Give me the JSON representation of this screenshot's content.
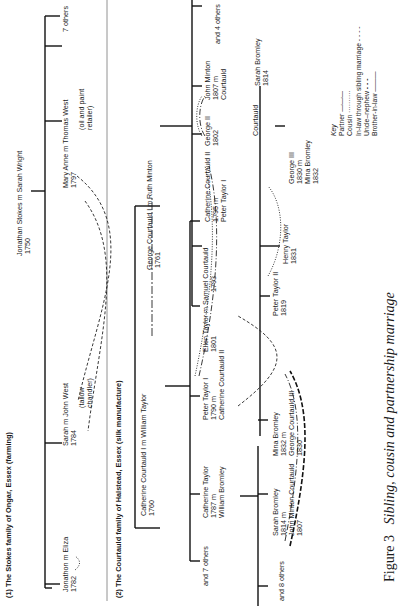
{
  "figure": {
    "label": "Figure 3",
    "title": "Sibling, cousin and partnership marriage"
  },
  "stokes": {
    "heading": "(1) The Stokes family of Ongar, Essex (farming)",
    "parents": {
      "line1": "Jonathan Stokes m Sarah Wright",
      "line2": "1750"
    },
    "children": [
      {
        "line1": "Jonathon  m  Eliza",
        "line2": "1782"
      },
      {
        "line1": "Sarah   m   John West",
        "line2": "1784",
        "line3": "(tallow",
        "line4": "chandler)"
      },
      {
        "line1": "Mary Anne   m   Thomas West",
        "line2": "1797",
        "line3": "(oil and paint",
        "line4": "retailer)"
      },
      {
        "line1": "7 others"
      }
    ]
  },
  "courtauld": {
    "heading": "(2) The Courtauld family of Halstead, Essex (silk manufacture)",
    "gen1": {
      "catherine": {
        "line1": "Catherine Courtauld I  m  William Taylor",
        "line2": "1760"
      },
      "george": {
        "line1": "George Courtauld I  m  Ruth Minton",
        "line2": "1761"
      }
    },
    "taylor_children": [
      {
        "line1": "and 7 others"
      },
      {
        "line1": "Catherine Taylor",
        "line2": "1787  m",
        "line3": "William Bromley"
      },
      {
        "line1": "Peter Taylor I",
        "line2": "1790  m",
        "line3": "Catherine Courtauld II"
      },
      {
        "line1": "Ellen Taylor  m  Samuel Courtauld",
        "line2": "1801",
        "line3": "1793"
      }
    ],
    "courtauld_children": [
      {
        "line1": "Catherine Courtauld II",
        "line2": "1795  m",
        "line3": "Peter Taylor I"
      },
      {
        "line1": "George II",
        "line2": "1802"
      },
      {
        "line1": "John Minton",
        "line2": "1807  m",
        "line3": "Courtauld"
      },
      {
        "line1": "and 4 others"
      }
    ],
    "bromley_children": [
      {
        "line1": "and 8 others"
      },
      {
        "line1": "Sarah Bromley",
        "line2": "1814  m",
        "line3": "John Minton Courtauld",
        "line4": "1807"
      },
      {
        "line1": "Mina Bromley",
        "line2": "1832  m",
        "line3": "George Courtauld III",
        "line4": "1830"
      }
    ],
    "peter_children": [
      {
        "line1": "Peter Taylor II",
        "line2": "1819"
      },
      {
        "line1": "Henry Taylor",
        "line2": "1831"
      }
    ],
    "john_children": [
      {
        "line1": "Courtauld"
      },
      {
        "line1": "George III",
        "line2": "1830  m",
        "line3": "Mina Bromley",
        "line4": "1832"
      },
      {
        "line1": "Sarah Bromley",
        "line2": "1814"
      }
    ]
  },
  "key": {
    "title": "Key",
    "items": [
      {
        "label": "Partner",
        "style": "dash-dot"
      },
      {
        "label": "Cousin",
        "style": "dotted"
      },
      {
        "label": "In-law through sibling marriage",
        "style": "dashed"
      },
      {
        "label": "Uncle–nephew",
        "style": "heavy-dashed"
      },
      {
        "label": "Brother-in-law",
        "style": "solid"
      }
    ]
  }
}
